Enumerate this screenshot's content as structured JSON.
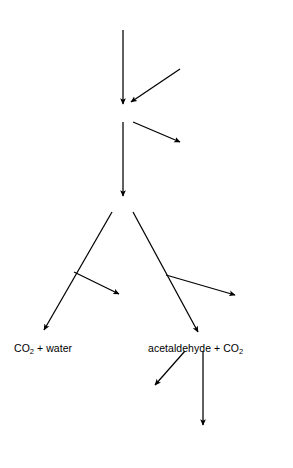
{
  "diagram": {
    "background_color": "#ffffff",
    "line_color": "#000000",
    "nodes": [
      {
        "id": "glucose",
        "text": "glucose (6C)",
        "x": 123,
        "y": 12,
        "align": "ctr",
        "style": "roman"
      },
      {
        "id": "phosphate-added",
        "text": "phosphate added",
        "x": 146,
        "y": 57,
        "align": "lft",
        "style": "roman"
      },
      {
        "id": "pga",
        "text": "phospho glyceraldehyde",
        "x": 123,
        "y": 112,
        "align": "ctr",
        "style": "roman"
      },
      {
        "id": "phosphate-lost",
        "text": "phosphate lost → ATP formed",
        "x": 288,
        "y": 145,
        "align": "rgt",
        "style": "roman"
      },
      {
        "id": "stored-energy",
        "text": "(stored energy)",
        "x": 288,
        "y": 157,
        "align": "rgt",
        "style": "roman"
      },
      {
        "id": "pyruvic",
        "text": "pyruvic acid (3C)",
        "x": 122,
        "y": 203,
        "align": "ctr",
        "style": "roman"
      },
      {
        "id": "aerobic-1",
        "text": "aerobic",
        "x": 40,
        "y": 240,
        "align": "lft",
        "style": "ital"
      },
      {
        "id": "aerobic-2",
        "text": "respiration",
        "x": 40,
        "y": 253,
        "align": "lft",
        "style": "ital"
      },
      {
        "id": "aerobic-3",
        "text": "+ oxygen",
        "x": 40,
        "y": 266,
        "align": "lft",
        "style": "roman"
      },
      {
        "id": "anaerobic-1",
        "text": "anaerobic respiration",
        "x": 169,
        "y": 251,
        "align": "lft",
        "style": "ital"
      },
      {
        "id": "anaerobic-2",
        "text": "(fermentation)",
        "x": 185,
        "y": 263,
        "align": "lft",
        "style": "ital"
      },
      {
        "id": "high-yield",
        "text": "high energy yield",
        "x": 75,
        "y": 300,
        "align": "lft",
        "style": "roman"
      },
      {
        "id": "low-yield",
        "text": "low energy yield",
        "x": 194,
        "y": 300,
        "align": "lft",
        "style": "roman"
      },
      {
        "id": "co2-water",
        "text": "CO2 + water",
        "x": 14,
        "y": 342,
        "align": "lft",
        "style": "roman",
        "sub": "2"
      },
      {
        "id": "acetaldehyde",
        "text": "acetaldehyde + CO2",
        "x": 148,
        "y": 342,
        "align": "lft",
        "style": "roman",
        "sub": "2"
      },
      {
        "id": "ethyl-alcohol",
        "text": "ethyl alcohol",
        "x": 118,
        "y": 392,
        "align": "lft",
        "style": "roman"
      },
      {
        "id": "acetic-1",
        "text": "acetic acid and",
        "x": 163,
        "y": 434,
        "align": "lft",
        "style": "roman"
      },
      {
        "id": "acetic-2",
        "text": "other products",
        "x": 163,
        "y": 446,
        "align": "lft",
        "style": "roman"
      }
    ],
    "edges": [
      {
        "id": "glucose-to-pga",
        "label": "glucose to phospho glyceraldehyde",
        "x1": 123,
        "y1": 30,
        "x2": 123,
        "y2": 104,
        "arrow": true
      },
      {
        "id": "phosphate-added-to-pga",
        "label": "phosphate added into pathway",
        "x1": 180,
        "y1": 69,
        "x2": 131,
        "y2": 102,
        "arrow": true
      },
      {
        "id": "pga-to-pyruvic",
        "label": "phospho glyceraldehyde to pyruvic acid",
        "x1": 123,
        "y1": 122,
        "x2": 123,
        "y2": 196,
        "arrow": true
      },
      {
        "id": "pga-to-phosphate-lost",
        "label": "phosphate lost branch",
        "x1": 133,
        "y1": 122,
        "x2": 180,
        "y2": 142,
        "arrow": true
      },
      {
        "id": "pyruvic-to-aerobic",
        "label": "pyruvic acid aerobic branch",
        "x1": 112,
        "y1": 212,
        "x2": 44,
        "y2": 330,
        "arrow": true
      },
      {
        "id": "pyruvic-to-anaerobic",
        "label": "pyruvic acid anaerobic branch",
        "x1": 133,
        "y1": 212,
        "x2": 198,
        "y2": 332,
        "arrow": true
      },
      {
        "id": "aerobic-high-yield",
        "label": "high energy yield arrow",
        "x1": 74,
        "y1": 272,
        "x2": 119,
        "y2": 294,
        "arrow": true
      },
      {
        "id": "anaerobic-low-yield",
        "label": "low energy yield arrow",
        "x1": 166,
        "y1": 275,
        "x2": 235,
        "y2": 295,
        "arrow": true
      },
      {
        "id": "acetaldehyde-to-ethanol",
        "label": "acetaldehyde to ethyl alcohol",
        "x1": 185,
        "y1": 351,
        "x2": 155,
        "y2": 385,
        "arrow": true
      },
      {
        "id": "acetaldehyde-to-acetic",
        "label": "acetaldehyde to acetic acid",
        "x1": 203,
        "y1": 351,
        "x2": 203,
        "y2": 425,
        "arrow": true
      }
    ]
  }
}
